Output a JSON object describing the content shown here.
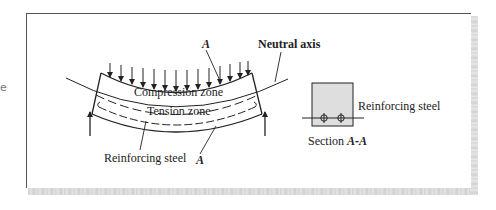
{
  "figure": {
    "type": "reinforced-concrete-beam-bending-diagram",
    "edge_fragment": "e",
    "labels": {
      "section_marker_top": "A",
      "section_marker_bottom": "A",
      "neutral_axis": "Neutral axis",
      "compression_zone": "Compression zone",
      "tension_zone": "Tension zone",
      "reinforcing_steel_beam": "Reinforcing steel",
      "reinforcing_steel_section": "Reinforcing steel",
      "section_caption_prefix": "Section ",
      "section_caption_id": "A-A"
    },
    "load_arrow_count": 14,
    "support_count": 2,
    "rebar_count_in_section": 2,
    "colors": {
      "line": "#222222",
      "section_fill": "#dcdcdc",
      "frame_border": "#555555",
      "shadow": "#d6d6d6"
    }
  }
}
